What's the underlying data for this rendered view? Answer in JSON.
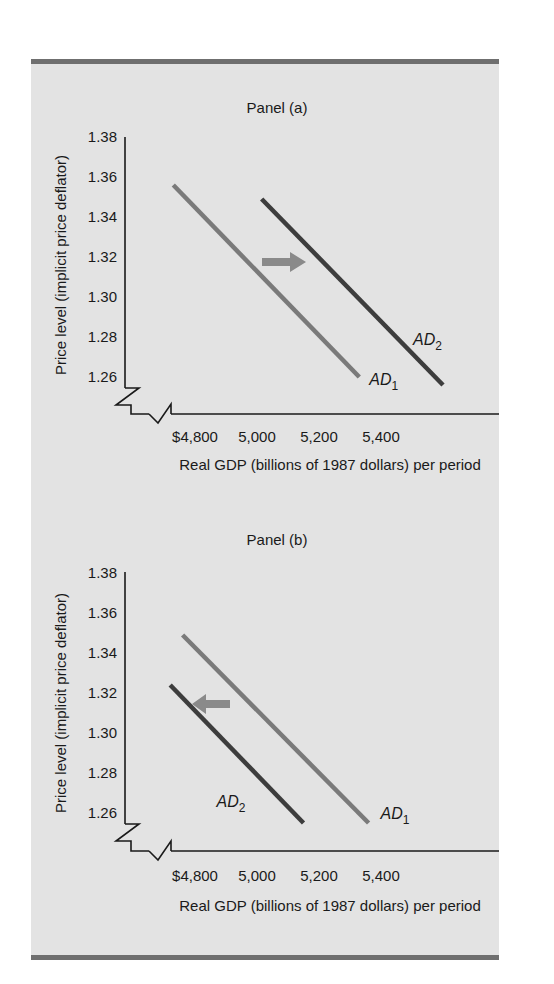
{
  "colors": {
    "background": "#e3e3e3",
    "border": "#6f6f6f",
    "axis": "#1a1a1a",
    "ad1": "#7a7a7a",
    "ad2": "#3d3d3d",
    "arrow": "#8a8a8a"
  },
  "chart_data": [
    {
      "type": "line",
      "title": "Panel (a)",
      "xlabel": "Real GDP (billions of 1987 dollars) per period",
      "ylabel": "Price level (implicit price deflator)",
      "xticks": [
        4800,
        5000,
        5200,
        5400
      ],
      "xtick_labels": [
        "$4,800",
        "5,000",
        "5,200",
        "5,400"
      ],
      "yticks": [
        1.38,
        1.36,
        1.34,
        1.32,
        1.3,
        1.28,
        1.26
      ],
      "ytick_labels": [
        "1.38",
        "1.36",
        "1.34",
        "1.32",
        "1.30",
        "1.28",
        "1.26"
      ],
      "axis_break": true,
      "grid": false,
      "series": [
        {
          "name": "AD1",
          "label_main": "AD",
          "label_sub": "1",
          "color_key": "ad1",
          "points": [
            [
              4730,
              1.356
            ],
            [
              5330,
              1.26
            ]
          ]
        },
        {
          "name": "AD2",
          "label_main": "AD",
          "label_sub": "2",
          "color_key": "ad2",
          "points": [
            [
              5015,
              1.349
            ],
            [
              5600,
              1.256
            ]
          ]
        }
      ],
      "annotations": [
        {
          "type": "arrow",
          "direction": "right",
          "meaning": "AD shifts right (increase)"
        }
      ]
    },
    {
      "type": "line",
      "title": "Panel (b)",
      "xlabel": "Real GDP (billions of 1987 dollars) per period",
      "ylabel": "Price level (implicit price deflator)",
      "xticks": [
        4800,
        5000,
        5200,
        5400
      ],
      "xtick_labels": [
        "$4,800",
        "5,000",
        "5,200",
        "5,400"
      ],
      "yticks": [
        1.38,
        1.36,
        1.34,
        1.32,
        1.3,
        1.28,
        1.26
      ],
      "ytick_labels": [
        "1.38",
        "1.36",
        "1.34",
        "1.32",
        "1.30",
        "1.28",
        "1.26"
      ],
      "axis_break": true,
      "grid": false,
      "series": [
        {
          "name": "AD1",
          "label_main": "AD",
          "label_sub": "1",
          "color_key": "ad1",
          "points": [
            [
              4760,
              1.349
            ],
            [
              5360,
              1.255
            ]
          ]
        },
        {
          "name": "AD2",
          "label_main": "AD",
          "label_sub": "2",
          "color_key": "ad2",
          "points": [
            [
              4720,
              1.324
            ],
            [
              5150,
              1.255
            ]
          ]
        }
      ],
      "annotations": [
        {
          "type": "arrow",
          "direction": "left",
          "meaning": "AD shifts left (decrease)"
        }
      ]
    }
  ]
}
